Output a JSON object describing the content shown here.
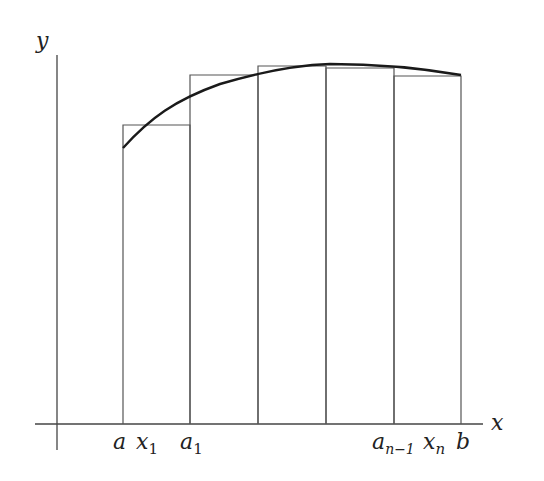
{
  "diagram": {
    "axes": {
      "x_label": "x",
      "y_label": "y",
      "origin": [
        57,
        424
      ],
      "x_axis": {
        "x1": 35,
        "x2": 483,
        "y": 424
      },
      "y_axis": {
        "x": 57,
        "y1": 55,
        "y2": 450
      }
    },
    "partition_x": [
      123,
      190,
      258,
      326,
      394,
      461
    ],
    "rectangles": [
      {
        "x0": 123,
        "x1": 190,
        "top": 125
      },
      {
        "x0": 190,
        "x1": 258,
        "top": 75
      },
      {
        "x0": 258,
        "x1": 326,
        "top": 66
      },
      {
        "x0": 326,
        "x1": 394,
        "top": 68
      },
      {
        "x0": 394,
        "x1": 461,
        "top": 76
      }
    ],
    "curve_path": "M123,148 C150,118 175,100 220,84 C260,72 300,65 330,64 C380,64 420,68 461,75",
    "tick_labels": [
      {
        "base": "a",
        "sub": "",
        "x": 113
      },
      {
        "base": "x",
        "sub": "1",
        "x": 138
      },
      {
        "base": "a",
        "sub": "1",
        "x": 180
      },
      {
        "base": "a",
        "sub": "n−1",
        "x": 373
      },
      {
        "base": "x",
        "sub": "n",
        "x": 424
      },
      {
        "base": "b",
        "sub": "",
        "x": 456
      }
    ],
    "colors": {
      "line": "#444444",
      "curve": "#1a1a1a",
      "background": "#ffffff"
    }
  }
}
